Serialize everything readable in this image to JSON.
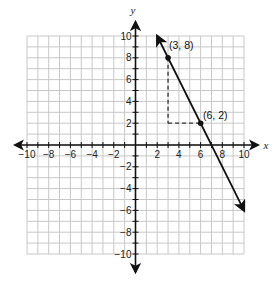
{
  "chart_data": {
    "type": "line",
    "title": "",
    "xlabel": "x",
    "ylabel": "y",
    "xlim": [
      -10,
      10
    ],
    "ylim": [
      -10,
      10
    ],
    "grid": true,
    "x_tick_labels": [
      "-10",
      "-8",
      "-6",
      "-4",
      "-2",
      "2",
      "4",
      "6",
      "8",
      "10"
    ],
    "y_tick_labels": [
      "10",
      "8",
      "6",
      "4",
      "2",
      "-2",
      "-4",
      "-6",
      "-8",
      "-10"
    ],
    "line": {
      "equation": "y = -2x + 14",
      "slope": -2,
      "intercept": 14,
      "start": {
        "x": 2,
        "y": 10
      },
      "end": {
        "x": 10,
        "y": -6
      },
      "arrows": "both"
    },
    "points": [
      {
        "x": 3,
        "y": 8,
        "label": "(3, 8)"
      },
      {
        "x": 6,
        "y": 2,
        "label": "(6, 2)"
      }
    ],
    "annotations": [
      {
        "type": "dashed-segment",
        "from": {
          "x": 3,
          "y": 8
        },
        "to": {
          "x": 3,
          "y": 2
        },
        "meaning": "rise"
      },
      {
        "type": "dashed-segment",
        "from": {
          "x": 3,
          "y": 2
        },
        "to": {
          "x": 6,
          "y": 2
        },
        "meaning": "run"
      }
    ]
  },
  "labels": {
    "x_axis": "x",
    "y_axis": "y",
    "point_a": "(3, 8)",
    "point_b": "(6, 2)"
  },
  "colors": {
    "grid": "#c8c8c8",
    "axis": "#111111",
    "line": "#111111"
  }
}
